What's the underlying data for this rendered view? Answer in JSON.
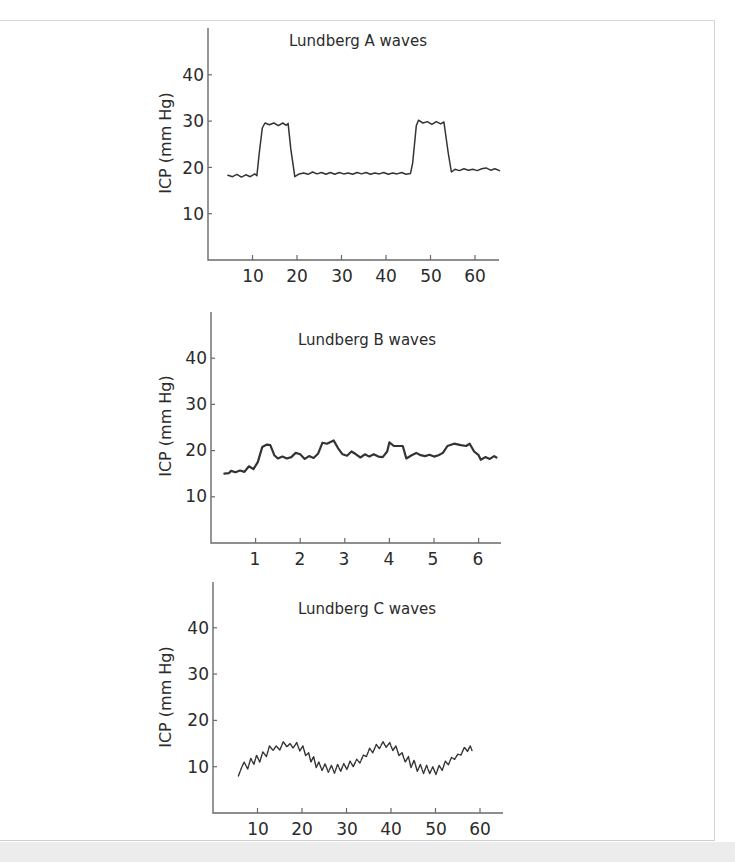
{
  "chart_data": [
    {
      "type": "line",
      "title": "Lundberg A waves",
      "xlabel": "",
      "ylabel": "ICP (mm Hg)",
      "xlim": [
        0,
        66
      ],
      "ylim": [
        0,
        50
      ],
      "xticks": [
        10,
        20,
        30,
        40,
        50,
        60
      ],
      "yticks": [
        10,
        20,
        30,
        40
      ],
      "grid": false,
      "legend": null,
      "layout": {
        "x0": 208,
        "xEnd": 499,
        "yAxisTop": 28,
        "yBase": 260,
        "pxPerX": 4.45,
        "pxPerY": 4.63,
        "lineWidth": 1.5,
        "dashed": false
      },
      "series": [
        {
          "name": "ICP",
          "points": [
            [
              4.5,
              18.3
            ],
            [
              5.5,
              18.0
            ],
            [
              6.5,
              18.5
            ],
            [
              7.5,
              17.9
            ],
            [
              8.5,
              18.4
            ],
            [
              9.5,
              18.0
            ],
            [
              10.5,
              18.6
            ],
            [
              11,
              18.2
            ],
            [
              11.5,
              23
            ],
            [
              12.2,
              28.5
            ],
            [
              12.8,
              29.6
            ],
            [
              13.8,
              29.2
            ],
            [
              14.8,
              29.6
            ],
            [
              15.8,
              29.0
            ],
            [
              16.8,
              29.6
            ],
            [
              17.6,
              29.1
            ],
            [
              18,
              29.5
            ],
            [
              18.6,
              24
            ],
            [
              19.5,
              18.0
            ],
            [
              20.5,
              18.6
            ],
            [
              21.5,
              18.8
            ],
            [
              22.5,
              18.5
            ],
            [
              23.5,
              19.0
            ],
            [
              24.5,
              18.6
            ],
            [
              25.5,
              18.9
            ],
            [
              26.5,
              18.5
            ],
            [
              27.5,
              18.9
            ],
            [
              28.5,
              18.5
            ],
            [
              29.5,
              18.9
            ],
            [
              30.5,
              18.6
            ],
            [
              31.5,
              18.8
            ],
            [
              32.5,
              18.5
            ],
            [
              33.5,
              18.9
            ],
            [
              34.5,
              18.6
            ],
            [
              35.5,
              18.9
            ],
            [
              36.5,
              18.5
            ],
            [
              37.5,
              18.8
            ],
            [
              38.5,
              18.6
            ],
            [
              39.5,
              18.9
            ],
            [
              40.5,
              18.5
            ],
            [
              41.5,
              18.8
            ],
            [
              42.5,
              18.6
            ],
            [
              43.5,
              18.9
            ],
            [
              44.5,
              18.5
            ],
            [
              45.5,
              18.7
            ],
            [
              46,
              21
            ],
            [
              46.8,
              29
            ],
            [
              47.3,
              30.2
            ],
            [
              48.3,
              29.6
            ],
            [
              49.3,
              29.9
            ],
            [
              50.3,
              29.3
            ],
            [
              51.3,
              29.9
            ],
            [
              52.3,
              29.4
            ],
            [
              53,
              29.8
            ],
            [
              54,
              23
            ],
            [
              54.7,
              19.0
            ],
            [
              55.5,
              19.6
            ],
            [
              56.5,
              19.3
            ],
            [
              57.5,
              19.7
            ],
            [
              58.5,
              19.4
            ],
            [
              59.5,
              19.6
            ],
            [
              60.5,
              19.3
            ],
            [
              61.5,
              19.7
            ],
            [
              62.5,
              19.9
            ],
            [
              63.5,
              19.4
            ],
            [
              64.5,
              19.7
            ],
            [
              65.5,
              19.3
            ]
          ]
        }
      ]
    },
    {
      "type": "line",
      "title": "Lundberg B waves",
      "xlabel": "",
      "ylabel": "ICP (mm Hg)",
      "xlim": [
        0,
        6.5
      ],
      "ylim": [
        0,
        50
      ],
      "xticks": [
        1,
        2,
        3,
        4,
        5,
        6
      ],
      "yticks": [
        10,
        20,
        30,
        40
      ],
      "grid": false,
      "legend": null,
      "layout": {
        "x0": 211,
        "xEnd": 501,
        "yAxisTop": 312,
        "yBase": 543,
        "pxPerX": 44.6,
        "pxPerY": 4.62,
        "lineWidth": 2.2,
        "dashed": false
      },
      "series": [
        {
          "name": "ICP",
          "points": [
            [
              0.3,
              15
            ],
            [
              0.4,
              15.1
            ],
            [
              0.45,
              15.6
            ],
            [
              0.55,
              15.3
            ],
            [
              0.65,
              15.7
            ],
            [
              0.75,
              15.4
            ],
            [
              0.85,
              16.6
            ],
            [
              0.95,
              16
            ],
            [
              1.05,
              17.5
            ],
            [
              1.15,
              20.8
            ],
            [
              1.25,
              21.3
            ],
            [
              1.33,
              21.2
            ],
            [
              1.42,
              19
            ],
            [
              1.5,
              18.3
            ],
            [
              1.6,
              18.7
            ],
            [
              1.7,
              18.3
            ],
            [
              1.8,
              18.6
            ],
            [
              1.9,
              19.5
            ],
            [
              2.0,
              19.2
            ],
            [
              2.1,
              18.2
            ],
            [
              2.2,
              18.8
            ],
            [
              2.3,
              18.4
            ],
            [
              2.4,
              19.3
            ],
            [
              2.5,
              21.7
            ],
            [
              2.6,
              21.5
            ],
            [
              2.75,
              22.2
            ],
            [
              2.85,
              20.5
            ],
            [
              2.95,
              19.2
            ],
            [
              3.05,
              18.9
            ],
            [
              3.15,
              19.8
            ],
            [
              3.25,
              19.2
            ],
            [
              3.35,
              18.5
            ],
            [
              3.45,
              19.2
            ],
            [
              3.55,
              18.7
            ],
            [
              3.65,
              19.2
            ],
            [
              3.75,
              18.7
            ],
            [
              3.85,
              18.6
            ],
            [
              3.95,
              19.8
            ],
            [
              4.0,
              21.8
            ],
            [
              4.1,
              21.0
            ],
            [
              4.2,
              21.0
            ],
            [
              4.3,
              21.0
            ],
            [
              4.38,
              18.3
            ],
            [
              4.5,
              19.0
            ],
            [
              4.6,
              19.5
            ],
            [
              4.7,
              19.0
            ],
            [
              4.8,
              18.8
            ],
            [
              4.9,
              19.1
            ],
            [
              5.0,
              18.7
            ],
            [
              5.1,
              19.0
            ],
            [
              5.2,
              19.5
            ],
            [
              5.3,
              21.0
            ],
            [
              5.45,
              21.5
            ],
            [
              5.6,
              21.2
            ],
            [
              5.72,
              21.0
            ],
            [
              5.8,
              21.5
            ],
            [
              5.9,
              19.8
            ],
            [
              6.0,
              19.0
            ],
            [
              6.05,
              18.0
            ],
            [
              6.15,
              18.6
            ],
            [
              6.25,
              18.2
            ],
            [
              6.35,
              18.8
            ],
            [
              6.4,
              18.5
            ]
          ]
        }
      ]
    },
    {
      "type": "line",
      "title": "Lundberg C waves",
      "xlabel": "",
      "ylabel": "ICP (mm Hg)",
      "xlim": [
        0,
        65
      ],
      "ylim": [
        0,
        50
      ],
      "xticks": [
        10,
        20,
        30,
        40,
        50,
        60
      ],
      "yticks": [
        10,
        20,
        30,
        40
      ],
      "grid": false,
      "legend": null,
      "layout": {
        "x0": 213,
        "xEnd": 503,
        "yAxisTop": 582,
        "yBase": 813,
        "pxPerX": 4.45,
        "pxPerY": 4.63,
        "lineWidth": 1.4,
        "dashed": true
      },
      "series": [
        {
          "name": "ICP",
          "points": [
            [
              5.7,
              8.0
            ],
            [
              6.5,
              10.0
            ],
            [
              7,
              11.0
            ],
            [
              7.8,
              9.5
            ],
            [
              8.5,
              11.8
            ],
            [
              9.2,
              10.5
            ],
            [
              9.8,
              12.5
            ],
            [
              10.5,
              11.0
            ],
            [
              11.2,
              13.2
            ],
            [
              12,
              12.2
            ],
            [
              12.7,
              14.5
            ],
            [
              13.5,
              13.5
            ],
            [
              14.2,
              14.5
            ],
            [
              15,
              13.6
            ],
            [
              15.8,
              15.4
            ],
            [
              16.6,
              14.3
            ],
            [
              17.3,
              15.0
            ],
            [
              18,
              14.0
            ],
            [
              18.8,
              15.2
            ],
            [
              19.5,
              13.4
            ],
            [
              20.2,
              14.5
            ],
            [
              20.8,
              12.4
            ],
            [
              21.5,
              13.0
            ],
            [
              22,
              11.0
            ],
            [
              22.6,
              12.2
            ],
            [
              23.2,
              9.8
            ],
            [
              23.8,
              11.0
            ],
            [
              24.5,
              9.2
            ],
            [
              25.2,
              10.6
            ],
            [
              25.9,
              8.8
            ],
            [
              26.6,
              10.3
            ],
            [
              27.3,
              8.6
            ],
            [
              28,
              10.5
            ],
            [
              28.7,
              9.0
            ],
            [
              29.4,
              10.7
            ],
            [
              30.1,
              9.4
            ],
            [
              30.8,
              11.2
            ],
            [
              31.5,
              10.0
            ],
            [
              32.3,
              11.6
            ],
            [
              33,
              10.8
            ],
            [
              33.8,
              12.5
            ],
            [
              34.5,
              12.2
            ],
            [
              35.2,
              14.0
            ],
            [
              35.9,
              13.0
            ],
            [
              36.7,
              14.8
            ],
            [
              37.4,
              13.9
            ],
            [
              38.2,
              15.4
            ],
            [
              38.9,
              14.2
            ],
            [
              39.7,
              15.2
            ],
            [
              40.4,
              13.5
            ],
            [
              41.1,
              14.5
            ],
            [
              41.8,
              12.4
            ],
            [
              42.5,
              13.0
            ],
            [
              43.2,
              11.0
            ],
            [
              43.9,
              12.2
            ],
            [
              44.5,
              9.8
            ],
            [
              45.2,
              11.4
            ],
            [
              45.9,
              9.0
            ],
            [
              46.6,
              10.5
            ],
            [
              47.3,
              8.5
            ],
            [
              48,
              10.3
            ],
            [
              48.7,
              8.5
            ],
            [
              49.4,
              10.0
            ],
            [
              50.1,
              8.3
            ],
            [
              50.8,
              10.3
            ],
            [
              51.5,
              9.2
            ],
            [
              52.2,
              11.2
            ],
            [
              52.9,
              10.4
            ],
            [
              53.6,
              12.0
            ],
            [
              54.3,
              11.6
            ],
            [
              55,
              12.7
            ],
            [
              55.7,
              12.5
            ],
            [
              56.5,
              14.2
            ],
            [
              57.2,
              13.3
            ],
            [
              57.8,
              14.5
            ],
            [
              58.2,
              13.5
            ]
          ]
        }
      ]
    }
  ],
  "charts": [
    {
      "title": "Lundberg A waves",
      "ylabel": "ICP (mm Hg)",
      "yticks": [
        "10",
        "20",
        "30",
        "40"
      ],
      "xticks": [
        "10",
        "20",
        "30",
        "40",
        "50",
        "60"
      ]
    },
    {
      "title": "Lundberg B waves",
      "ylabel": "ICP (mm Hg)",
      "yticks": [
        "10",
        "20",
        "30",
        "40"
      ],
      "xticks": [
        "1",
        "2",
        "3",
        "4",
        "5",
        "6"
      ]
    },
    {
      "title": "Lundberg C waves",
      "ylabel": "ICP (mm Hg)",
      "yticks": [
        "10",
        "20",
        "30",
        "40"
      ],
      "xticks": [
        "10",
        "20",
        "30",
        "40",
        "50",
        "60"
      ]
    }
  ],
  "colors": {
    "line": "#333333",
    "axis": "#6a6a6a",
    "text": "#2b2b2b",
    "background": "#ffffff",
    "footer": "#ececec"
  }
}
